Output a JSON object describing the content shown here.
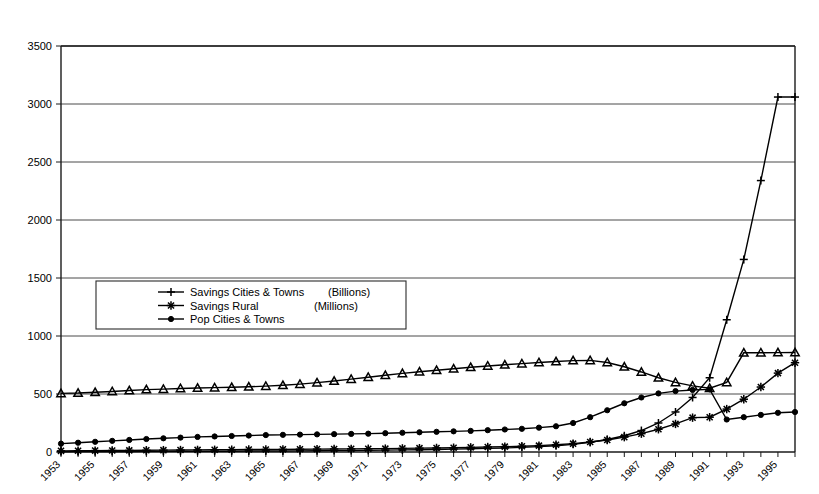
{
  "chart_data": {
    "type": "line",
    "title": "",
    "subtitle": "",
    "xlabel": "",
    "ylabel": "",
    "ylim": [
      0,
      3500
    ],
    "ytick_step": 500,
    "yticks": [
      "0",
      "500",
      "1000",
      "1500",
      "2000",
      "2500",
      "3000",
      "3500"
    ],
    "grid": true,
    "grid_axis": "y",
    "legend_position": "center-left",
    "x": [
      1953,
      1954,
      1955,
      1956,
      1957,
      1958,
      1959,
      1960,
      1961,
      1962,
      1963,
      1964,
      1965,
      1966,
      1967,
      1968,
      1969,
      1970,
      1971,
      1972,
      1973,
      1974,
      1975,
      1976,
      1977,
      1978,
      1979,
      1980,
      1981,
      1982,
      1983,
      1984,
      1985,
      1986,
      1987,
      1988,
      1989,
      1990,
      1991,
      1992,
      1993,
      1994,
      1995,
      1996
    ],
    "xtick_labels": [
      "1953",
      "1955",
      "1957",
      "1959",
      "1961",
      "1963",
      "1965",
      "1967",
      "1969",
      "1971",
      "1973",
      "1975",
      "1977",
      "1979",
      "1981",
      "1983",
      "1985",
      "1987",
      "1989",
      "1991",
      "1993",
      "1995"
    ],
    "xtick_every": 2,
    "series": [
      {
        "name": "Savings Cities & Towns",
        "unit": "(Billions)",
        "marker": "plus",
        "values": [
          2,
          3,
          3,
          4,
          4,
          5,
          5,
          6,
          6,
          7,
          7,
          8,
          9,
          9,
          10,
          11,
          12,
          13,
          14,
          16,
          18,
          20,
          22,
          25,
          28,
          31,
          35,
          40,
          46,
          54,
          66,
          84,
          108,
          140,
          185,
          250,
          345,
          470,
          640,
          1140,
          1660,
          2340,
          3060,
          3060
        ]
      },
      {
        "name": "Savings Rural",
        "unit": "(Millions)",
        "marker": "asterisk",
        "values": [
          10,
          11,
          12,
          13,
          14,
          15,
          16,
          17,
          18,
          19,
          20,
          21,
          22,
          23,
          24,
          25,
          26,
          27,
          28,
          29,
          31,
          33,
          35,
          37,
          40,
          43,
          46,
          50,
          55,
          62,
          72,
          86,
          104,
          128,
          158,
          196,
          242,
          296,
          300,
          370,
          455,
          560,
          680,
          770
        ]
      },
      {
        "name": "Pop Cities & Towns",
        "unit": "",
        "marker": "circle-filled",
        "values": [
          72,
          80,
          88,
          96,
          104,
          112,
          118,
          124,
          130,
          134,
          138,
          142,
          146,
          148,
          150,
          152,
          154,
          156,
          158,
          162,
          166,
          170,
          174,
          178,
          182,
          188,
          194,
          200,
          210,
          222,
          250,
          300,
          360,
          420,
          470,
          505,
          525,
          535,
          540,
          280,
          300,
          320,
          338,
          345
        ]
      },
      {
        "name": "",
        "unit": "",
        "marker": "triangle",
        "values": [
          505,
          508,
          515,
          522,
          530,
          538,
          542,
          548,
          552,
          555,
          558,
          562,
          568,
          575,
          585,
          598,
          612,
          628,
          645,
          662,
          678,
          692,
          705,
          718,
          730,
          742,
          752,
          762,
          772,
          780,
          788,
          790,
          772,
          735,
          690,
          640,
          600,
          570,
          550,
          600,
          855,
          856,
          857,
          858
        ]
      }
    ],
    "annotations": [
      {
        "text": "(Billions)",
        "series": "Savings Cities & Towns"
      },
      {
        "text": "(Millions)",
        "series": "Savings Rural"
      }
    ]
  },
  "legend": {
    "entries": [
      {
        "label": "Savings Cities & Towns",
        "unit": "(Billions)",
        "marker": "plus"
      },
      {
        "label": "Savings Rural",
        "unit": "(Millions)",
        "marker": "asterisk"
      },
      {
        "label": "Pop Cities & Towns",
        "unit": "",
        "marker": "circle-filled"
      }
    ]
  }
}
